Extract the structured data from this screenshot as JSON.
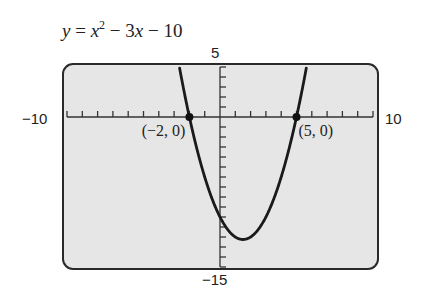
{
  "title": {
    "lhs": "y",
    "eq": " = ",
    "x": "x",
    "exp": "2",
    "rest1": " − 3",
    "x2": "x",
    "rest2": " − 10"
  },
  "window": {
    "xmin_label": "−10",
    "xmax_label": "10",
    "ymax_label": "5",
    "ymin_label": "−15"
  },
  "points": [
    {
      "label": "(−2, 0)",
      "x": -2,
      "y": 0
    },
    {
      "label": "(5, 0)",
      "x": 5,
      "y": 0
    }
  ],
  "colors": {
    "screen_bg": "#e6e6e6",
    "border": "#2a2a2a",
    "curve": "#1a1a1a"
  },
  "chart_data": {
    "type": "line",
    "function": "x^2 - 3x - 10",
    "xlabel": "",
    "ylabel": "",
    "xlim": [
      -10,
      10
    ],
    "ylim": [
      -15,
      5
    ],
    "xscale_ticks": 1,
    "yscale_ticks": 1,
    "grid": false,
    "x": [
      -2.62,
      -2,
      -1,
      0,
      1,
      1.5,
      2,
      3,
      4,
      5,
      5.62
    ],
    "series": [
      {
        "name": "y = x^2 - 3x - 10",
        "values": [
          5,
          0,
          -6,
          -10,
          -12,
          -12.25,
          -12,
          -10,
          -6,
          0,
          5
        ]
      }
    ],
    "annotations": [
      {
        "text": "(−2, 0)",
        "x": -2,
        "y": 0
      },
      {
        "text": "(5, 0)",
        "x": 5,
        "y": 0
      }
    ],
    "vertex": {
      "x": 1.5,
      "y": -12.25
    }
  }
}
